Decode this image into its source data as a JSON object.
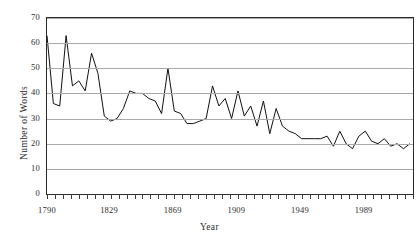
{
  "chart_data": {
    "type": "line",
    "title": "",
    "xlabel": "Year",
    "ylabel": "Number of Words",
    "xlim": [
      1790,
      2020
    ],
    "ylim": [
      0,
      70
    ],
    "yticks": [
      0,
      10,
      20,
      30,
      40,
      50,
      60,
      70
    ],
    "xtick_labels": [
      "1790",
      "1829",
      "1869",
      "1909",
      "1949",
      "1989"
    ],
    "xtick_label_values": [
      1790,
      1829,
      1869,
      1909,
      1949,
      1989
    ],
    "tick_interval_years": 5,
    "grid": "horizontal",
    "legend": "none",
    "series_color": "#111111",
    "grid_color": "#a9a9a9",
    "axis_color": "#2c2c2c",
    "background": "#ffffff",
    "x": [
      1790,
      1794,
      1798,
      1802,
      1806,
      1810,
      1814,
      1818,
      1822,
      1826,
      1830,
      1834,
      1838,
      1842,
      1846,
      1850,
      1854,
      1858,
      1862,
      1866,
      1870,
      1874,
      1878,
      1882,
      1886,
      1890,
      1894,
      1898,
      1902,
      1906,
      1910,
      1914,
      1918,
      1922,
      1926,
      1930,
      1934,
      1938,
      1942,
      1946,
      1950,
      1954,
      1958,
      1962,
      1966,
      1970,
      1974,
      1978,
      1982,
      1986,
      1990,
      1994,
      1998,
      2002,
      2006,
      2010,
      2014,
      2018
    ],
    "values": [
      63,
      36,
      35,
      63,
      43,
      45,
      41,
      56,
      48,
      31,
      29,
      30,
      34,
      41,
      40,
      40,
      38,
      37,
      32,
      50,
      33,
      32,
      28,
      28,
      29,
      30,
      43,
      35,
      38,
      30,
      41,
      31,
      35,
      27,
      37,
      24,
      34,
      27,
      25,
      24,
      22,
      22,
      22,
      22,
      23,
      19,
      25,
      20,
      18,
      23,
      25,
      21,
      20,
      22,
      19,
      20,
      18,
      20
    ]
  }
}
